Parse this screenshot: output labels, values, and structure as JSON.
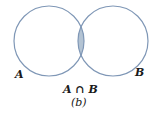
{
  "diagram": {
    "type": "venn",
    "sets": [
      {
        "id": "A",
        "label": "A",
        "cx": 49,
        "cy": 41,
        "r": 35
      },
      {
        "id": "B",
        "label": "B",
        "cx": 113,
        "cy": 41,
        "r": 35
      }
    ],
    "highlighted_region": "A ∩ B",
    "intersection_label": "A ∩ B",
    "caption": "(b)",
    "colors": {
      "stroke": "#7f97b6",
      "fill_intersection": "#b3c3d3",
      "background": "#ffffff",
      "text": "#1a1a1a"
    }
  }
}
